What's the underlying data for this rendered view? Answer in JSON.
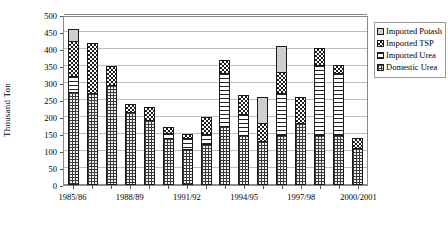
{
  "chart_data": {
    "type": "bar",
    "subtype": "stacked-column",
    "title": "",
    "xlabel": "",
    "ylabel": "Thousand Ton",
    "ylim": [
      0,
      500
    ],
    "ytick_step": 50,
    "yticks": [
      0,
      50,
      100,
      150,
      200,
      250,
      300,
      350,
      400,
      450,
      500
    ],
    "grid": true,
    "legend_position": "right",
    "categories": [
      "1985/86",
      "1986/87",
      "1987/88",
      "1988/89",
      "1989/90",
      "1990/91",
      "1991/92",
      "1992/93",
      "1993/94",
      "1994/95",
      "1995/96",
      "1996/97",
      "1997/98",
      "1998/99",
      "1999/2000",
      "2000/2001"
    ],
    "xtick_labels_shown": [
      "1985/86",
      "1988/89",
      "1991/92",
      "1994/95",
      "1997/98",
      "2000/2001"
    ],
    "series": [
      {
        "name": "Domestic Urea",
        "pattern": "fine-grid",
        "values": [
          275,
          272,
          293,
          215,
          192,
          137,
          105,
          120,
          175,
          148,
          128,
          148,
          182,
          147,
          148,
          108
        ]
      },
      {
        "name": "Imported Urea",
        "pattern": "horizontal-dash",
        "values": [
          47,
          0,
          0,
          0,
          0,
          16,
          33,
          30,
          155,
          62,
          0,
          123,
          0,
          205,
          182,
          0
        ]
      },
      {
        "name": "Imported TSP",
        "pattern": "checkerboard",
        "values": [
          103,
          147,
          57,
          23,
          37,
          17,
          12,
          50,
          37,
          56,
          55,
          60,
          78,
          52,
          22,
          30
        ]
      },
      {
        "name": "Imported Potash",
        "pattern": "solid-gray",
        "values": [
          33,
          0,
          0,
          0,
          0,
          0,
          0,
          0,
          0,
          0,
          75,
          77,
          0,
          0,
          0,
          0
        ]
      }
    ],
    "totals": [
      458,
      419,
      350,
      238,
      229,
      170,
      150,
      200,
      367,
      266,
      258,
      408,
      260,
      404,
      352,
      138
    ]
  },
  "legend": {
    "items": [
      {
        "label": "Imported Potash",
        "key": "potash"
      },
      {
        "label": "Imported TSP",
        "key": "tsp"
      },
      {
        "label": "Imported Urea",
        "key": "impurea"
      },
      {
        "label": "Domestic Urea",
        "key": "domestic"
      }
    ]
  }
}
